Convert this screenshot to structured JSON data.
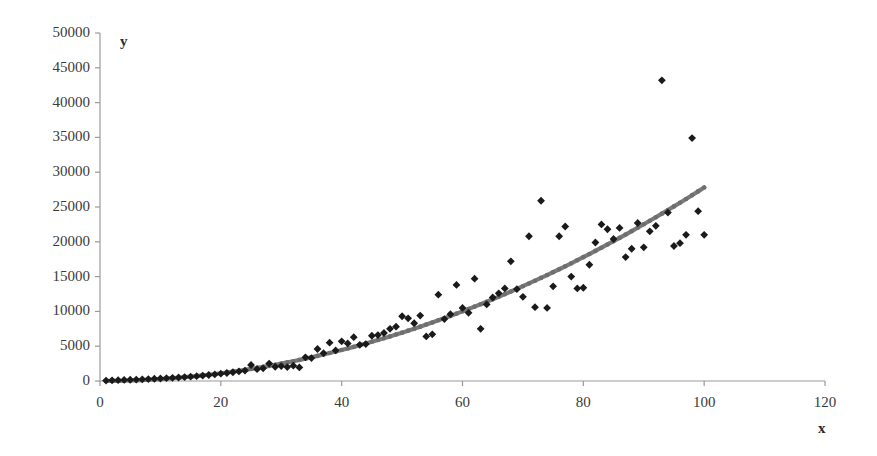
{
  "chart_data": {
    "type": "scatter",
    "title": "",
    "xlabel": "x",
    "ylabel": "y",
    "xlim": [
      0,
      120
    ],
    "ylim": [
      0,
      50000
    ],
    "xticks": [
      0,
      20,
      40,
      60,
      80,
      100,
      120
    ],
    "yticks": [
      0,
      5000,
      10000,
      15000,
      20000,
      25000,
      30000,
      35000,
      40000,
      45000,
      50000
    ],
    "grid": false,
    "legend": "none",
    "marker": "diamond",
    "colors": {
      "points": "#1a1a1a",
      "trend": "#7a7a7a",
      "axis": "#9a9a9a",
      "text": "#3a3a3a",
      "background": "#ffffff"
    },
    "series": [
      {
        "name": "observed",
        "type": "scatter",
        "points": [
          [
            1,
            60
          ],
          [
            2,
            90
          ],
          [
            3,
            120
          ],
          [
            4,
            150
          ],
          [
            5,
            180
          ],
          [
            6,
            210
          ],
          [
            7,
            240
          ],
          [
            8,
            280
          ],
          [
            9,
            320
          ],
          [
            10,
            360
          ],
          [
            11,
            400
          ],
          [
            12,
            450
          ],
          [
            13,
            500
          ],
          [
            14,
            560
          ],
          [
            15,
            620
          ],
          [
            16,
            700
          ],
          [
            17,
            780
          ],
          [
            18,
            860
          ],
          [
            19,
            950
          ],
          [
            20,
            1050
          ],
          [
            21,
            1150
          ],
          [
            22,
            1260
          ],
          [
            23,
            1380
          ],
          [
            24,
            1500
          ],
          [
            25,
            2300
          ],
          [
            26,
            1700
          ],
          [
            27,
            1820
          ],
          [
            28,
            2500
          ],
          [
            29,
            2050
          ],
          [
            30,
            2150
          ],
          [
            31,
            2000
          ],
          [
            32,
            2200
          ],
          [
            33,
            1950
          ],
          [
            34,
            3400
          ],
          [
            35,
            3300
          ],
          [
            36,
            4600
          ],
          [
            37,
            4000
          ],
          [
            38,
            5500
          ],
          [
            39,
            4400
          ],
          [
            40,
            5700
          ],
          [
            41,
            5400
          ],
          [
            42,
            6300
          ],
          [
            43,
            5200
          ],
          [
            44,
            5300
          ],
          [
            45,
            6500
          ],
          [
            46,
            6600
          ],
          [
            47,
            6900
          ],
          [
            48,
            7500
          ],
          [
            49,
            7800
          ],
          [
            50,
            9300
          ],
          [
            51,
            9000
          ],
          [
            52,
            8300
          ],
          [
            53,
            9400
          ],
          [
            54,
            6400
          ],
          [
            55,
            6700
          ],
          [
            56,
            12400
          ],
          [
            57,
            8900
          ],
          [
            58,
            9600
          ],
          [
            59,
            13800
          ],
          [
            60,
            10500
          ],
          [
            61,
            9800
          ],
          [
            62,
            14700
          ],
          [
            63,
            7500
          ],
          [
            64,
            11000
          ],
          [
            65,
            12000
          ],
          [
            66,
            12600
          ],
          [
            67,
            13300
          ],
          [
            68,
            17200
          ],
          [
            69,
            13200
          ],
          [
            70,
            12100
          ],
          [
            71,
            20800
          ],
          [
            72,
            10600
          ],
          [
            73,
            25900
          ],
          [
            74,
            10500
          ],
          [
            75,
            13600
          ],
          [
            76,
            20800
          ],
          [
            77,
            22200
          ],
          [
            78,
            15000
          ],
          [
            79,
            13300
          ],
          [
            80,
            13400
          ],
          [
            81,
            16700
          ],
          [
            82,
            19900
          ],
          [
            83,
            22500
          ],
          [
            84,
            21800
          ],
          [
            85,
            20400
          ],
          [
            86,
            22000
          ],
          [
            87,
            17800
          ],
          [
            88,
            19000
          ],
          [
            89,
            22700
          ],
          [
            90,
            19200
          ],
          [
            91,
            21500
          ],
          [
            92,
            22300
          ],
          [
            93,
            43200
          ],
          [
            94,
            24200
          ],
          [
            95,
            19400
          ],
          [
            96,
            19800
          ],
          [
            97,
            21000
          ],
          [
            98,
            34900
          ],
          [
            99,
            24400
          ],
          [
            100,
            21000
          ]
        ]
      },
      {
        "name": "fitted trend",
        "type": "line",
        "points": [
          [
            1,
            10
          ],
          [
            2,
            20
          ],
          [
            3,
            35
          ],
          [
            4,
            55
          ],
          [
            5,
            80
          ],
          [
            6,
            110
          ],
          [
            7,
            145
          ],
          [
            8,
            185
          ],
          [
            9,
            230
          ],
          [
            10,
            280
          ],
          [
            11,
            340
          ],
          [
            12,
            400
          ],
          [
            13,
            470
          ],
          [
            14,
            545
          ],
          [
            15,
            625
          ],
          [
            16,
            715
          ],
          [
            17,
            810
          ],
          [
            18,
            910
          ],
          [
            19,
            1015
          ],
          [
            20,
            1125
          ],
          [
            21,
            1245
          ],
          [
            22,
            1370
          ],
          [
            23,
            1500
          ],
          [
            24,
            1640
          ],
          [
            25,
            1790
          ],
          [
            26,
            1945
          ],
          [
            27,
            2105
          ],
          [
            28,
            2275
          ],
          [
            29,
            2450
          ],
          [
            30,
            2635
          ],
          [
            31,
            2830
          ],
          [
            32,
            3030
          ],
          [
            33,
            3240
          ],
          [
            34,
            3455
          ],
          [
            35,
            3680
          ],
          [
            36,
            3915
          ],
          [
            37,
            4155
          ],
          [
            38,
            4405
          ],
          [
            39,
            4660
          ],
          [
            40,
            4925
          ],
          [
            41,
            5200
          ],
          [
            42,
            5480
          ],
          [
            43,
            5770
          ],
          [
            44,
            6065
          ],
          [
            45,
            6370
          ],
          [
            46,
            6685
          ],
          [
            47,
            7005
          ],
          [
            48,
            7335
          ],
          [
            49,
            7675
          ],
          [
            50,
            8020
          ],
          [
            51,
            8375
          ],
          [
            52,
            8740
          ],
          [
            53,
            9110
          ],
          [
            54,
            9490
          ],
          [
            55,
            9880
          ],
          [
            56,
            10275
          ],
          [
            57,
            10680
          ],
          [
            58,
            11095
          ],
          [
            59,
            11520
          ],
          [
            60,
            11950
          ],
          [
            61,
            12390
          ],
          [
            62,
            12840
          ],
          [
            63,
            13295
          ],
          [
            64,
            13760
          ],
          [
            65,
            14235
          ],
          [
            66,
            14720
          ],
          [
            67,
            15210
          ],
          [
            68,
            15710
          ],
          [
            69,
            16220
          ],
          [
            70,
            16735
          ],
          [
            71,
            17260
          ],
          [
            72,
            17795
          ],
          [
            73,
            18340
          ],
          [
            74,
            18890
          ],
          [
            75,
            19450
          ],
          [
            76,
            20020
          ],
          [
            77,
            20600
          ],
          [
            78,
            21185
          ],
          [
            79,
            21780
          ],
          [
            80,
            22385
          ],
          [
            81,
            22995
          ],
          [
            82,
            23615
          ],
          [
            83,
            24245
          ],
          [
            84,
            24885
          ],
          [
            85,
            25530
          ],
          [
            86,
            26185
          ],
          [
            87,
            26850
          ],
          [
            88,
            27525
          ],
          [
            89,
            28205
          ],
          [
            90,
            28895
          ],
          [
            91,
            29600
          ],
          [
            92,
            30310
          ],
          [
            93,
            31025
          ],
          [
            94,
            31755
          ],
          [
            95,
            32490
          ],
          [
            96,
            33235
          ],
          [
            97,
            33990
          ],
          [
            98,
            34750
          ],
          [
            99,
            35525
          ],
          [
            100,
            36305
          ]
        ],
        "note": "rendered trend curve follows y = 2.78*x^2 from x=1 to x=100"
      }
    ]
  },
  "labels": {
    "x_axis_title": "x",
    "y_axis_title": "y"
  },
  "yticklabels": [
    "0",
    "5000",
    "10000",
    "15000",
    "20000",
    "25000",
    "30000",
    "35000",
    "40000",
    "45000",
    "50000"
  ],
  "xticklabels": [
    "0",
    "20",
    "40",
    "60",
    "80",
    "100",
    "120"
  ]
}
